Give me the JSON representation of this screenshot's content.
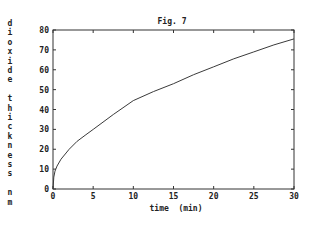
{
  "chart_data": {
    "type": "line",
    "title": "Fig. 7",
    "xlabel": "time  (min)",
    "ylabel": "dioxide thickness nm",
    "ylabel_letters": [
      "d",
      "i",
      "o",
      "x",
      "i",
      "d",
      "e",
      "",
      "t",
      "h",
      "i",
      "c",
      "k",
      "n",
      "e",
      "s",
      "s",
      "",
      "n",
      "m"
    ],
    "xlim": [
      0,
      30
    ],
    "ylim": [
      0,
      80
    ],
    "xticks": [
      0,
      5,
      10,
      15,
      20,
      25,
      30
    ],
    "yticks": [
      0,
      10,
      20,
      30,
      40,
      50,
      60,
      70,
      80
    ],
    "grid": false,
    "legend": null,
    "series": [
      {
        "name": "dioxide thickness",
        "color": "#3a3a3a",
        "x": [
          0,
          0.1,
          0.25,
          0.5,
          1,
          2,
          3,
          4,
          5,
          7.5,
          10,
          12.5,
          15,
          17.5,
          20,
          22.5,
          25,
          27.5,
          30
        ],
        "y": [
          0,
          6,
          9,
          11.5,
          15,
          20,
          24,
          27,
          30,
          37.5,
          44.5,
          49,
          53,
          57.5,
          61.5,
          65.5,
          69,
          72.5,
          75.5
        ]
      }
    ]
  }
}
